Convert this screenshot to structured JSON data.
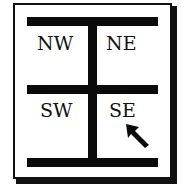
{
  "diagram": {
    "type": "quadrant-selector",
    "quadrants": {
      "nw": "NW",
      "ne": "NE",
      "sw": "SW",
      "se": "SE"
    },
    "selected": "SE",
    "pointer": "arrow-cursor-icon",
    "colors": {
      "ink": "#0a0a0a",
      "background": "#ffffff"
    }
  }
}
